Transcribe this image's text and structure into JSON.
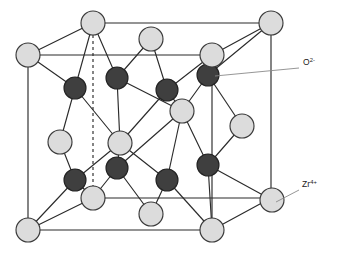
{
  "figure": {
    "background_color": "#ffffff",
    "width": 338,
    "height": 256
  },
  "colors": {
    "cation_fill": "#dcdcdc",
    "cation_stroke": "#3a3a3a",
    "anion_fill": "#3f3f3f",
    "anion_stroke": "#232323",
    "edge": "#2b2b2b",
    "bond": "#2b2b2b",
    "leader": "#8a8a8a",
    "label_text": "#1a1a1a"
  },
  "labels": [
    {
      "id": "anion-label",
      "name": "oxide-ion-label",
      "base": "O",
      "charge": "2-",
      "full_text": "O2-",
      "x": 303,
      "y": 65,
      "leader": {
        "x1": 299,
        "y1": 68,
        "x2": 215,
        "y2": 76
      }
    },
    {
      "id": "cation-label",
      "name": "zirconium-ion-label",
      "base": "Zr",
      "charge": "4+",
      "full_text": "Zr4+",
      "x": 302,
      "y": 187,
      "leader": {
        "x1": 299,
        "y1": 190,
        "x2": 276,
        "y2": 202
      }
    }
  ],
  "geometry": {
    "cube_vertices": {
      "front_top_left": [
        28,
        55
      ],
      "front_top_right": [
        212,
        55
      ],
      "front_bottom_left": [
        28,
        230
      ],
      "front_bottom_right": [
        212,
        230
      ],
      "back_top_left": [
        93,
        23
      ],
      "back_top_right": [
        271,
        23
      ],
      "back_bottom_left": [
        93,
        198
      ],
      "back_bottom_right": [
        271,
        198
      ]
    },
    "hidden_edge": {
      "x1": 93,
      "y1": 35,
      "x2": 93,
      "y2": 186
    },
    "cation_radius": 12,
    "anion_radius": 11
  },
  "atoms": {
    "cations": [
      {
        "name": "zr-corner-front-top-left",
        "x": 28,
        "y": 55
      },
      {
        "name": "zr-corner-front-top-right",
        "x": 212,
        "y": 55
      },
      {
        "name": "zr-corner-front-bottom-left",
        "x": 28,
        "y": 230
      },
      {
        "name": "zr-corner-front-bottom-right",
        "x": 212,
        "y": 230
      },
      {
        "name": "zr-corner-back-top-left",
        "x": 93,
        "y": 23
      },
      {
        "name": "zr-corner-back-top-right",
        "x": 271,
        "y": 23
      },
      {
        "name": "zr-corner-back-bottom-left",
        "x": 93,
        "y": 198
      },
      {
        "name": "zr-corner-back-bottom-right",
        "x": 272,
        "y": 200
      },
      {
        "name": "zr-face-top",
        "x": 151,
        "y": 39
      },
      {
        "name": "zr-face-bottom",
        "x": 151,
        "y": 214
      },
      {
        "name": "zr-face-left",
        "x": 60,
        "y": 142
      },
      {
        "name": "zr-face-right",
        "x": 242,
        "y": 126
      },
      {
        "name": "zr-face-front",
        "x": 120,
        "y": 143
      },
      {
        "name": "zr-face-back",
        "x": 182,
        "y": 111
      }
    ],
    "anions": [
      {
        "name": "o-tet-1",
        "x": 75,
        "y": 88
      },
      {
        "name": "o-tet-2",
        "x": 117,
        "y": 78
      },
      {
        "name": "o-tet-3",
        "x": 167,
        "y": 90
      },
      {
        "name": "o-tet-4",
        "x": 208,
        "y": 75
      },
      {
        "name": "o-tet-5",
        "x": 75,
        "y": 180
      },
      {
        "name": "o-tet-6",
        "x": 117,
        "y": 168
      },
      {
        "name": "o-tet-7",
        "x": 167,
        "y": 180
      },
      {
        "name": "o-tet-8",
        "x": 208,
        "y": 165
      }
    ]
  },
  "bonds": [
    [
      75,
      88,
      28,
      55
    ],
    [
      75,
      88,
      93,
      23
    ],
    [
      75,
      88,
      60,
      142
    ],
    [
      75,
      88,
      120,
      143
    ],
    [
      117,
      78,
      93,
      23
    ],
    [
      117,
      78,
      151,
      39
    ],
    [
      117,
      78,
      120,
      143
    ],
    [
      117,
      78,
      182,
      111
    ],
    [
      167,
      90,
      151,
      39
    ],
    [
      167,
      90,
      212,
      55
    ],
    [
      167,
      90,
      120,
      143
    ],
    [
      167,
      90,
      182,
      111
    ],
    [
      208,
      75,
      212,
      55
    ],
    [
      208,
      75,
      271,
      23
    ],
    [
      208,
      75,
      182,
      111
    ],
    [
      208,
      75,
      242,
      126
    ],
    [
      75,
      180,
      28,
      230
    ],
    [
      75,
      180,
      93,
      198
    ],
    [
      75,
      180,
      60,
      142
    ],
    [
      75,
      180,
      120,
      143
    ],
    [
      117,
      168,
      93,
      198
    ],
    [
      117,
      168,
      151,
      214
    ],
    [
      117,
      168,
      120,
      143
    ],
    [
      117,
      168,
      182,
      111
    ],
    [
      167,
      180,
      151,
      214
    ],
    [
      167,
      180,
      212,
      230
    ],
    [
      167,
      180,
      120,
      143
    ],
    [
      167,
      180,
      182,
      111
    ],
    [
      208,
      165,
      212,
      230
    ],
    [
      208,
      165,
      272,
      200
    ],
    [
      208,
      165,
      182,
      111
    ],
    [
      208,
      165,
      242,
      126
    ]
  ]
}
